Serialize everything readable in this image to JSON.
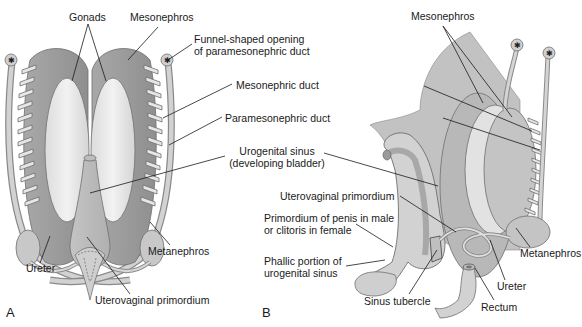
{
  "figure": {
    "panels": [
      {
        "id": "A",
        "label": "A"
      },
      {
        "id": "B",
        "label": "B"
      }
    ],
    "colors": {
      "tissue_dark": "#9a9a9a",
      "tissue_mid": "#b9b9b9",
      "tissue_light": "#d6d6d6",
      "gonad_light": "#eaeaea",
      "outline": "#6e6e6e",
      "leader_line": "#1a1a1a",
      "text": "#1a1a1a",
      "background": "#ffffff"
    }
  },
  "labels": {
    "gonads": "Gonads",
    "mesonephros_a": "Mesonephros",
    "funnel_line1": "Funnel-shaped opening",
    "funnel_line2": "of paramesonephric duct",
    "mesonephric_duct": "Mesonephric duct",
    "paramesonephric_duct": "Paramesonephric duct",
    "urogenital_sinus_line1": "Urogenital sinus",
    "urogenital_sinus_line2": "(developing bladder)",
    "ureter_a": "Ureter",
    "metanephros_a": "Metanephros",
    "uterovaginal_a": "Uterovaginal primordium",
    "mesonephros_b": "Mesonephros",
    "uterovaginal_b": "Uterovaginal primordium",
    "penis_line1": "Primordium of penis in male",
    "penis_line2": "or clitoris in female",
    "phallic_line1": "Phallic portion of",
    "phallic_line2": "urogenital sinus",
    "metanephros_b": "Metanephros",
    "ureter_b": "Ureter",
    "sinus_tubercle": "Sinus tubercle",
    "rectum": "Rectum"
  }
}
